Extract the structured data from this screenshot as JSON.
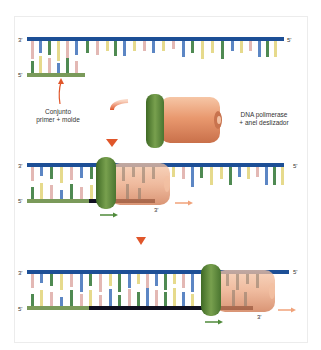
{
  "figure": {
    "labels": {
      "primer_template": [
        "Conjunto",
        "primer + molde"
      ],
      "polymerase_clamp": [
        "DNA polimerase",
        "+ anel deslizador"
      ]
    },
    "strand_end_labels": {
      "three_prime": "3'",
      "five_prime": "5'"
    },
    "panels": [
      {
        "id": "panel-1",
        "description": "primer-template junction"
      },
      {
        "id": "panel-2",
        "description": "polymerase + sliding clamp bound, synthesis starts"
      },
      {
        "id": "panel-3",
        "description": "polymerase + clamp moved along, extended new strand"
      }
    ],
    "colors": {
      "template_strand": "#1d4f96",
      "primer": "#7a9a5a",
      "new_strand": "#101020",
      "clamp": "#5f8a3a",
      "polymerase": "#e8a07a",
      "arrow_red": "#e0562a",
      "base_blue": "#5c86c4",
      "base_green": "#4f8a52",
      "base_yellow": "#e6da8c",
      "base_pink": "#e3b8b4"
    }
  }
}
